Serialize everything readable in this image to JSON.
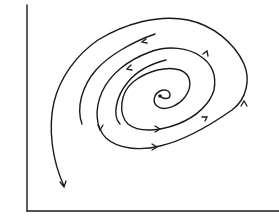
{
  "diagram": {
    "type": "phase-portrait",
    "colors": {
      "stroke": "#1a1a1a",
      "background": "#ffffff"
    },
    "axes": {
      "x_label": "",
      "y_label": ""
    },
    "fixed_point": {
      "x": 160,
      "y": 96
    },
    "arrows": [
      {
        "x": 143,
        "y": 41,
        "direction": "left-down"
      },
      {
        "x": 128,
        "y": 67,
        "direction": "left-down"
      },
      {
        "x": 100,
        "y": 128,
        "direction": "down"
      },
      {
        "x": 158,
        "y": 129,
        "direction": "right"
      },
      {
        "x": 155,
        "y": 147,
        "direction": "right"
      },
      {
        "x": 206,
        "y": 118,
        "direction": "right-up"
      },
      {
        "x": 206,
        "y": 52,
        "direction": "left-up"
      },
      {
        "x": 244,
        "y": 104,
        "direction": "up"
      },
      {
        "x": 64,
        "y": 186,
        "direction": "down"
      }
    ]
  }
}
